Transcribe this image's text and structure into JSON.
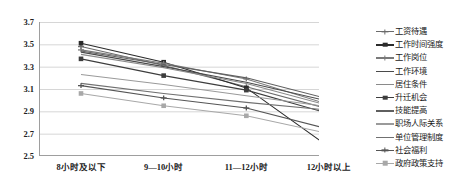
{
  "chart_data": {
    "type": "line",
    "title": "",
    "xlabel": "",
    "ylabel": "",
    "ylim": [
      2.5,
      3.7
    ],
    "yticks": [
      3.7,
      3.5,
      3.3,
      3.1,
      2.9,
      2.7,
      2.5
    ],
    "grid": true,
    "legend_position": "right",
    "categories": [
      "8小时及以下",
      "9—10小时",
      "11—12小时",
      "12小时以上"
    ],
    "series": [
      {
        "name": "工资待遇",
        "values": [
          3.48,
          3.31,
          3.12,
          2.92
        ],
        "color": "#6b6b6b",
        "marker": "plus"
      },
      {
        "name": "工作时间强度",
        "values": [
          3.51,
          3.34,
          3.11,
          2.58
        ],
        "color": "#2b2b2b",
        "marker": "square"
      },
      {
        "name": "工作岗位",
        "values": [
          3.45,
          3.33,
          3.19,
          2.96
        ],
        "color": "#7a7a7a",
        "marker": "plus"
      },
      {
        "name": "工作环境",
        "values": [
          3.43,
          3.3,
          3.16,
          2.99
        ],
        "color": "#4a4a4a",
        "marker": "none"
      },
      {
        "name": "居住条件",
        "values": [
          3.41,
          3.29,
          3.15,
          2.95
        ],
        "color": "#8a8a8a",
        "marker": "none"
      },
      {
        "name": "升迁机会",
        "values": [
          3.37,
          3.22,
          3.09,
          2.88
        ],
        "color": "#3d3d3d",
        "marker": "square"
      },
      {
        "name": "技能提高",
        "values": [
          3.44,
          3.32,
          3.2,
          3.01
        ],
        "color": "#5f5f5f",
        "marker": "none"
      },
      {
        "name": "职场人际关系",
        "values": [
          3.23,
          3.14,
          3.04,
          2.94
        ],
        "color": "#9a9a9a",
        "marker": "none"
      },
      {
        "name": "单位管理制度",
        "values": [
          3.15,
          3.06,
          2.98,
          2.91
        ],
        "color": "#707070",
        "marker": "none"
      },
      {
        "name": "社会福利",
        "values": [
          3.13,
          3.02,
          2.93,
          2.74
        ],
        "color": "#555555",
        "marker": "plus"
      },
      {
        "name": "政府政策支持",
        "values": [
          3.06,
          2.95,
          2.86,
          2.7
        ],
        "color": "#a8a8a8",
        "marker": "square"
      }
    ]
  },
  "axis": {
    "y_labels": [
      "3.7",
      "3.5",
      "3.3",
      "3.1",
      "2.9",
      "2.7",
      "2.5"
    ],
    "x_labels": [
      "8小时及以下",
      "9—10小时",
      "11—12小时",
      "12小时以上"
    ]
  },
  "style": {
    "grid_color": "#d6d6d6",
    "axis_color": "#9e9e9e",
    "background": "#ffffff"
  }
}
